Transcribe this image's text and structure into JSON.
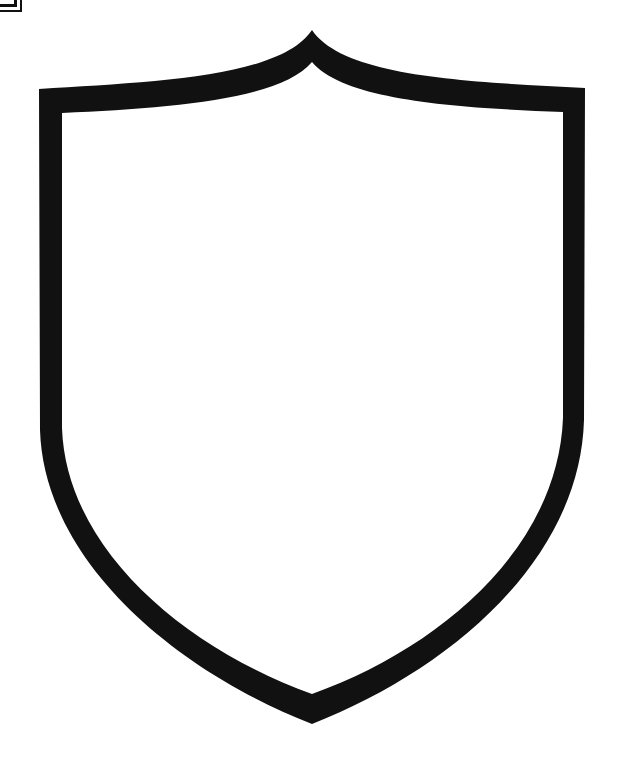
{
  "image": {
    "subject": "shield-outline",
    "colors": {
      "stroke": "#111111",
      "fill": "#ffffff",
      "background": "#ffffff"
    }
  },
  "corner_icon": {
    "name": "box-icon"
  }
}
